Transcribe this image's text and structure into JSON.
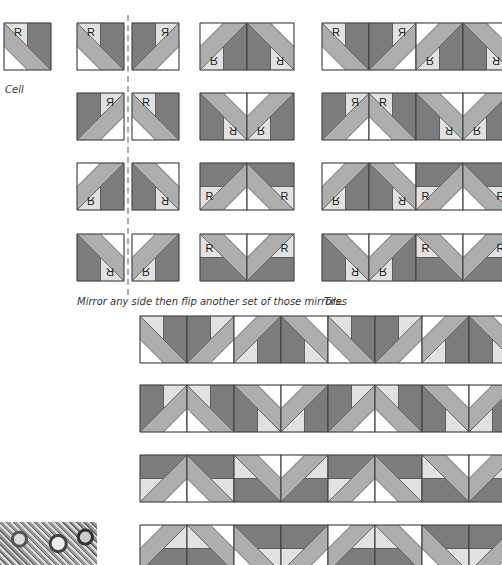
{
  "colors": {
    "light": "#e2e2e2",
    "medium": "#aeaeae",
    "dark": "#7c7c7c",
    "white": "#ffffff",
    "stroke": "#444444"
  },
  "captions": {
    "cell": "Cell",
    "mirror": "Mirror any side then flip another set of those mirrors.",
    "tiles": "Tiles"
  },
  "cell": {
    "label": "R",
    "x": 4,
    "y": 23,
    "size": 47
  },
  "mirror_pairs": [
    {
      "y": 23,
      "left": {
        "t": "id"
      },
      "right": {
        "t": "mx"
      }
    },
    {
      "y": 93,
      "left": {
        "t": "mx"
      },
      "right": {
        "t": "id"
      }
    },
    {
      "y": 163,
      "left": {
        "t": "my"
      },
      "right": {
        "t": "mxy"
      }
    },
    {
      "y": 234,
      "left": {
        "t": "mxy"
      },
      "right": {
        "t": "my"
      }
    }
  ],
  "tiles": [
    {
      "y": 23,
      "cells": [
        "my",
        "mxy"
      ]
    },
    {
      "y": 93,
      "cells": [
        "mxy",
        "my"
      ]
    },
    {
      "y": 163,
      "cells": [
        "rot",
        "rotm"
      ]
    },
    {
      "y": 234,
      "cells": [
        "rotf",
        "rotfm"
      ]
    }
  ],
  "strips": [
    {
      "y": 316
    },
    {
      "y": 385
    },
    {
      "y": 455
    },
    {
      "y": 525
    }
  ]
}
